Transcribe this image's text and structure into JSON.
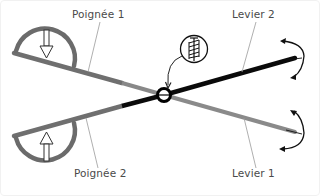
{
  "diagram": {
    "type": "scissors-lever-mechanism",
    "labels": {
      "handle_1": "Poignée 1",
      "handle_2": "Poignée 2",
      "lever_1": "Levier 1",
      "lever_2": "Levier 2"
    },
    "icons": {
      "pivot": "pivot-ring-icon",
      "spring_detail": "spring-hinge-icon",
      "press_down": "arrow-down-icon",
      "press_up": "arrow-up-icon",
      "rotation_top": "rotation-arrow-icon",
      "rotation_bottom": "rotation-arrow-icon"
    },
    "colors": {
      "lever_gray": "#7a7a7a",
      "lever_black": "#0a0a0a",
      "handle_arc": "#6b6b6b",
      "leader_line": "#9a9a9a",
      "text": "#4a4a4a",
      "background": "#ffffff"
    }
  }
}
